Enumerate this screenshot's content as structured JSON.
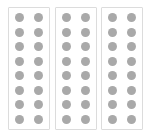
{
  "canvas": {
    "width": 148,
    "height": 139,
    "background_color": "#ffffff"
  },
  "figure": {
    "title": ""
  },
  "style": {
    "strip_fill": "#ffffff",
    "strip_border_color": "#dcdcdc",
    "well_color": "#a9a9a9",
    "well_diameter": 9
  },
  "strips": [
    {
      "id": "strip-1",
      "label": "1",
      "x": 8,
      "y": 7,
      "width": 42,
      "height": 123,
      "rows": 8,
      "columns": 2,
      "wells": [
        [
          "filled",
          "filled"
        ],
        [
          "filled",
          "filled"
        ],
        [
          "filled",
          "filled"
        ],
        [
          "filled",
          "filled"
        ],
        [
          "filled",
          "filled"
        ],
        [
          "filled",
          "filled"
        ],
        [
          "filled",
          "filled"
        ],
        [
          "filled",
          "filled"
        ]
      ]
    },
    {
      "id": "strip-2",
      "label": "2",
      "x": 55,
      "y": 7,
      "width": 42,
      "height": 123,
      "rows": 8,
      "columns": 2,
      "wells": [
        [
          "filled",
          "filled"
        ],
        [
          "filled",
          "filled"
        ],
        [
          "filled",
          "filled"
        ],
        [
          "filled",
          "filled"
        ],
        [
          "filled",
          "filled"
        ],
        [
          "filled",
          "filled"
        ],
        [
          "filled",
          "filled"
        ],
        [
          "filled",
          "filled"
        ]
      ]
    },
    {
      "id": "strip-3",
      "label": "3",
      "x": 101,
      "y": 7,
      "width": 42,
      "height": 123,
      "rows": 8,
      "columns": 2,
      "wells": [
        [
          "filled",
          "filled"
        ],
        [
          "filled",
          "filled"
        ],
        [
          "filled",
          "filled"
        ],
        [
          "filled",
          "filled"
        ],
        [
          "filled",
          "filled"
        ],
        [
          "filled",
          "filled"
        ],
        [
          "filled",
          "filled"
        ],
        [
          "filled",
          "filled"
        ]
      ]
    }
  ]
}
